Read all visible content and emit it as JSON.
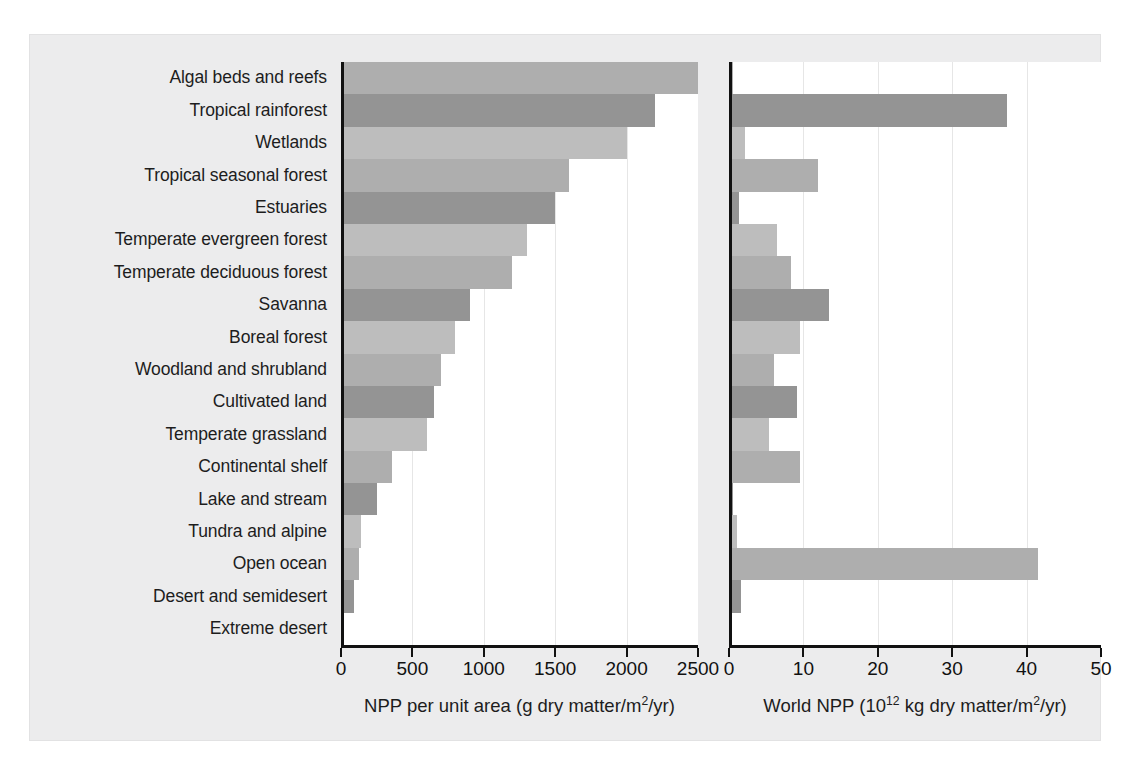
{
  "figure": {
    "background_color": "#ececed",
    "bar_colors": [
      "#aeaeae",
      "#949494",
      "#bdbdbd"
    ],
    "axis_color": "#111111",
    "grid_color": "#e6e6e6"
  },
  "categories": [
    "Algal beds and reefs",
    "Tropical rainforest",
    "Wetlands",
    "Tropical seasonal forest",
    "Estuaries",
    "Temperate evergreen forest",
    "Temperate deciduous forest",
    "Savanna",
    "Boreal forest",
    "Woodland and shrubland",
    "Cultivated land",
    "Temperate grassland",
    "Continental shelf",
    "Lake and stream",
    "Tundra and alpine",
    "Open ocean",
    "Desert and semidesert",
    "Extreme desert"
  ],
  "left_panel": {
    "axis_title_main": "NPP per unit area (g dry matter/m",
    "axis_title_sup": "2",
    "axis_title_tail": "/yr)",
    "ticks": [
      "0",
      "500",
      "1000",
      "1500",
      "2000",
      "2500"
    ],
    "tick_values": [
      0,
      500,
      1000,
      1500,
      2000,
      2500
    ],
    "xmin": 0,
    "xmax": 2500
  },
  "right_panel": {
    "axis_title_main": "World NPP (10",
    "axis_title_sup": "12",
    "axis_title_tail": " kg dry matter/m",
    "axis_title_sup2": "2",
    "axis_title_tail2": "/yr)",
    "ticks": [
      "0",
      "10",
      "20",
      "30",
      "40",
      "50"
    ],
    "tick_values": [
      0,
      10,
      20,
      30,
      40,
      50
    ],
    "xmin": 0,
    "xmax": 50
  },
  "chart_data": [
    {
      "type": "bar",
      "orientation": "horizontal",
      "title": "",
      "xlabel": "NPP per unit area (g dry matter/m2/yr)",
      "ylabel": "",
      "xlim": [
        0,
        2500
      ],
      "xticks": [
        0,
        500,
        1000,
        1500,
        2000,
        2500
      ],
      "grid": true,
      "legend": "none",
      "categories": [
        "Algal beds and reefs",
        "Tropical rainforest",
        "Wetlands",
        "Tropical seasonal forest",
        "Estuaries",
        "Temperate evergreen forest",
        "Temperate deciduous forest",
        "Savanna",
        "Boreal forest",
        "Woodland and shrubland",
        "Cultivated land",
        "Temperate grassland",
        "Continental shelf",
        "Lake and stream",
        "Tundra and alpine",
        "Open ocean",
        "Desert and semidesert",
        "Extreme desert"
      ],
      "values": [
        2500,
        2200,
        2000,
        1600,
        1500,
        1300,
        1200,
        900,
        800,
        700,
        650,
        600,
        360,
        250,
        140,
        125,
        90,
        3
      ]
    },
    {
      "type": "bar",
      "orientation": "horizontal",
      "title": "",
      "xlabel": "World NPP (10^12 kg dry matter/m2/yr)",
      "ylabel": "",
      "xlim": [
        0,
        50
      ],
      "xticks": [
        0,
        10,
        20,
        30,
        40,
        50
      ],
      "grid": true,
      "legend": "none",
      "categories": [
        "Algal beds and reefs",
        "Tropical rainforest",
        "Wetlands",
        "Tropical seasonal forest",
        "Estuaries",
        "Temperate evergreen forest",
        "Temperate deciduous forest",
        "Savanna",
        "Boreal forest",
        "Woodland and shrubland",
        "Cultivated land",
        "Temperate grassland",
        "Continental shelf",
        "Lake and stream",
        "Tundra and alpine",
        "Open ocean",
        "Desert and semidesert",
        "Extreme desert"
      ],
      "values": [
        0.6,
        37.4,
        2.1,
        12.0,
        1.4,
        6.4,
        8.4,
        13.5,
        9.6,
        6.0,
        9.1,
        5.4,
        9.6,
        0.5,
        1.1,
        41.5,
        1.6,
        0.07
      ]
    }
  ]
}
